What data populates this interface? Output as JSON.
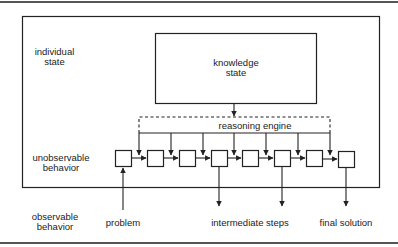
{
  "labels": {
    "individual_state": [
      "individual",
      "state"
    ],
    "knowledge_state": [
      "knowledge",
      "state"
    ],
    "reasoning_engine": "reasoning engine",
    "unobservable_behavior": [
      "unobservable",
      "behavior"
    ],
    "observable_behavior": [
      "observable",
      "behavior"
    ],
    "problem": "problem",
    "intermediate_steps": "intermediate steps",
    "final_solution": "final solution"
  },
  "colors": {
    "line": "#222222",
    "rule": "#555555",
    "background": "#ffffff"
  },
  "chain": {
    "box_count": 8,
    "box_x": [
      115,
      147,
      179,
      211,
      242,
      274,
      306,
      338
    ]
  }
}
